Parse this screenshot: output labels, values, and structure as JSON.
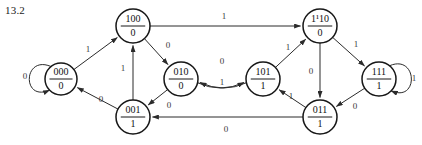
{
  "figure": {
    "caption": "13.2",
    "type": "state-transition-diagram"
  },
  "chart_data": {
    "type": "diagram",
    "title": "13.2",
    "subtitle": "",
    "xlabel": "",
    "ylabel": "",
    "grid": false,
    "legend": "none",
    "diagram_kind": "finite-state-machine",
    "node_label_format": "state / output",
    "nodes": [
      {
        "id": "000",
        "state": "000",
        "output": "0",
        "cx": 61,
        "cy": 79,
        "r": 16
      },
      {
        "id": "100",
        "state": "100",
        "output": "0",
        "cx": 133,
        "cy": 26,
        "r": 17
      },
      {
        "id": "010",
        "state": "010",
        "output": "0",
        "cx": 181,
        "cy": 79,
        "r": 17
      },
      {
        "id": "001",
        "state": "001",
        "output": "1",
        "cx": 133,
        "cy": 117,
        "r": 17
      },
      {
        "id": "110",
        "state": "1¹10",
        "output": "0",
        "cx": 320,
        "cy": 26,
        "r": 17
      },
      {
        "id": "101",
        "state": "101",
        "output": "1",
        "cx": 263,
        "cy": 79,
        "r": 17
      },
      {
        "id": "111",
        "state": "111",
        "output": "1",
        "cx": 379,
        "cy": 79,
        "r": 17
      },
      {
        "id": "011",
        "state": "011",
        "output": "1",
        "cx": 320,
        "cy": 117,
        "r": 17
      }
    ],
    "edges": [
      {
        "from": "000",
        "to": "000",
        "label": "0",
        "kind": "self-loop",
        "label_x": 25,
        "label_y": 77
      },
      {
        "from": "000",
        "to": "100",
        "label": "1",
        "kind": "line",
        "label_x": 88,
        "label_y": 50
      },
      {
        "from": "001",
        "to": "000",
        "label": "0",
        "kind": "line",
        "label_x": 101,
        "label_y": 100
      },
      {
        "from": "001",
        "to": "100",
        "label": "1",
        "kind": "line",
        "label_x": 123,
        "label_y": 69
      },
      {
        "from": "100",
        "to": "110",
        "label": "1",
        "kind": "line",
        "label_x": 224,
        "label_y": 17
      },
      {
        "from": "100",
        "to": "010",
        "label": "0",
        "kind": "line",
        "label_x": 168,
        "label_y": 46
      },
      {
        "from": "010",
        "to": "001",
        "label": "0",
        "kind": "line",
        "label_x": 169,
        "label_y": 106
      },
      {
        "from": "010",
        "to": "101",
        "label": "1",
        "kind": "curve",
        "label_x": 222,
        "label_y": 83
      },
      {
        "from": "101",
        "to": "010",
        "label": "0",
        "kind": "curve",
        "label_x": 222,
        "label_y": 62
      },
      {
        "from": "101",
        "to": "110",
        "label": "1",
        "kind": "line",
        "label_x": 288,
        "label_y": 48
      },
      {
        "from": "110",
        "to": "111",
        "label": "1",
        "kind": "line",
        "label_x": 356,
        "label_y": 45
      },
      {
        "from": "110",
        "to": "011",
        "label": "0",
        "kind": "line",
        "label_x": 311,
        "label_y": 72
      },
      {
        "from": "111",
        "to": "111",
        "label": "1",
        "kind": "self-loop",
        "label_x": 414,
        "label_y": 79
      },
      {
        "from": "111",
        "to": "011",
        "label": "0",
        "kind": "line",
        "label_x": 355,
        "label_y": 107
      },
      {
        "from": "011",
        "to": "101",
        "label": "1",
        "kind": "line",
        "label_x": 291,
        "label_y": 97
      },
      {
        "from": "011",
        "to": "001",
        "label": "0",
        "kind": "line",
        "label_x": 226,
        "label_y": 130
      }
    ],
    "colors": {
      "node_stroke": "#171717",
      "node_fill": "#ffffff",
      "edge_stroke": "#2b2b2b",
      "text": "#111111",
      "background": "#ffffff"
    }
  }
}
